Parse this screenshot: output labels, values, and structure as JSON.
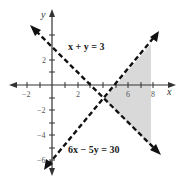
{
  "graph": {
    "x_axis_label": "x",
    "y_axis_label": "y",
    "x_tick_labels": [
      {
        "value": -2,
        "label": "−2"
      },
      {
        "value": 2,
        "label": "2"
      },
      {
        "value": 6,
        "label": "6"
      },
      {
        "value": 8,
        "label": "8"
      }
    ],
    "y_tick_labels": [
      {
        "value": 2,
        "label": "2"
      },
      {
        "value": -2,
        "label": "−2"
      },
      {
        "value": -4,
        "label": "−4"
      },
      {
        "value": -6,
        "label": "−6"
      }
    ],
    "lines": [
      {
        "equation": "x + y = 3",
        "style": "dashed"
      },
      {
        "equation": "6x − 5y = 30",
        "style": "dashed"
      }
    ],
    "shaded_region": {
      "description": "region right of both dashed lines, bounded at x ≈ 7.8",
      "color": "#d9d9d9"
    },
    "colors": {
      "axis": "#333333",
      "line": "#111111",
      "shade": "#d9d9d9"
    }
  }
}
